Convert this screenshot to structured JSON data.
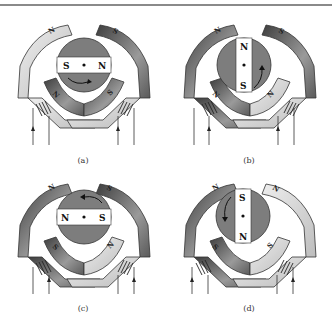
{
  "figure": {
    "panels": [
      {
        "id": "a",
        "caption": "(a)",
        "rotor": {
          "orientation": "horizontal",
          "left_label": "S",
          "right_label": "N",
          "rotation": "clockwise"
        },
        "stator": {
          "upper_left": "N",
          "upper_right": "S",
          "lower_left": "N",
          "lower_right": "S"
        },
        "upper_left_shade": "light",
        "upper_right_shade": "dark",
        "lower_left_shade": "dark",
        "lower_right_shade": "dark"
      },
      {
        "id": "b",
        "caption": "(b)",
        "rotor": {
          "orientation": "vertical",
          "top_label": "N",
          "bottom_label": "S",
          "rotation": "counterclockwise"
        },
        "stator": {
          "upper_left": "N",
          "upper_right": "S",
          "lower_left": "N",
          "lower_right": "N"
        },
        "upper_left_shade": "dark",
        "upper_right_shade": "dark",
        "lower_left_shade": "dark",
        "lower_right_shade": "light"
      },
      {
        "id": "c",
        "caption": "(c)",
        "rotor": {
          "orientation": "horizontal",
          "left_label": "N",
          "right_label": "S",
          "rotation": "counterclockwise"
        },
        "stator": {
          "upper_left": "N",
          "upper_right": "S",
          "lower_left": "S",
          "lower_right": "N"
        },
        "upper_left_shade": "dark",
        "upper_right_shade": "dark",
        "lower_left_shade": "dark",
        "lower_right_shade": "light"
      },
      {
        "id": "d",
        "caption": "(d)",
        "rotor": {
          "orientation": "vertical",
          "top_label": "S",
          "bottom_label": "N",
          "rotation": "counterclockwise"
        },
        "stator": {
          "upper_left": "N",
          "upper_right": "N",
          "lower_left": "S",
          "lower_right": "S"
        },
        "upper_left_shade": "dark",
        "upper_right_shade": "light",
        "lower_left_shade": "dark",
        "lower_right_shade": "light"
      }
    ],
    "colors": {
      "rotor_fill": "#7d7d7d",
      "magnet_bar": "#ffffff",
      "light_pole": "#d9d9d9",
      "dark_pole": "#555555",
      "mid_pole": "#9a9a9a",
      "outline": "#333333",
      "rule": "#8a8a8a"
    }
  }
}
